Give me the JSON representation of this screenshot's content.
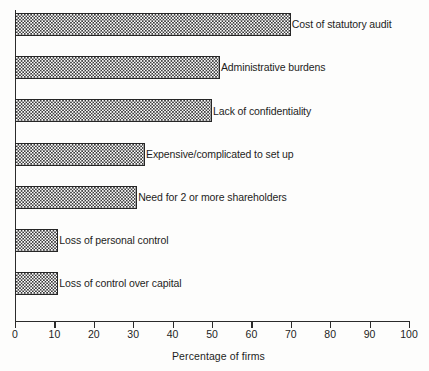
{
  "chart_data": {
    "type": "bar",
    "orientation": "horizontal",
    "title": "",
    "subtitle": "",
    "xlabel": "Percentage of firms",
    "ylabel": "",
    "xlim": [
      0,
      100
    ],
    "xticks": [
      0,
      10,
      20,
      30,
      40,
      50,
      60,
      70,
      80,
      90,
      100
    ],
    "xtick_labels": [
      "0",
      "10",
      "20",
      "30",
      "40",
      "50",
      "60",
      "70",
      "80",
      "90",
      "100"
    ],
    "grid": false,
    "legend": false,
    "legend_position": "none",
    "categories": [
      "Cost of statutory audit",
      "Administrative burdens",
      "Lack of confidentiality",
      "Expensive/complicated to set up",
      "Need for 2 or more shareholders",
      "Loss of personal control",
      "Loss of control over capital"
    ],
    "values": [
      70,
      52,
      50,
      33,
      31,
      11,
      11
    ],
    "bar_fill": "checkerboard-hatch",
    "bar_edge_color": "#262626",
    "background_color": "#ffffff",
    "text_color": "#1d1d1d"
  },
  "axis": {
    "x_title": "Percentage of firms"
  }
}
